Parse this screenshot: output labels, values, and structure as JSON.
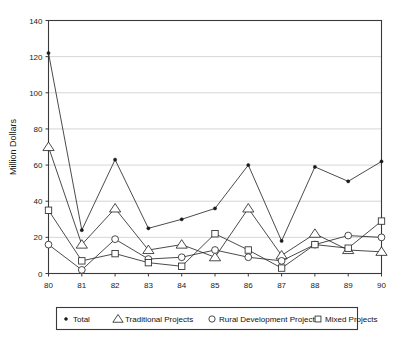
{
  "chart_data": {
    "type": "line",
    "title": "",
    "subtitle": "",
    "xlabel": "",
    "ylabel": "Million Dollars",
    "x": [
      "80",
      "81",
      "82",
      "83",
      "84",
      "85",
      "86",
      "87",
      "88",
      "89",
      "90"
    ],
    "categories": [
      "80",
      "81",
      "82",
      "83",
      "84",
      "85",
      "86",
      "87",
      "88",
      "89",
      "90"
    ],
    "xlim": [
      80,
      90
    ],
    "ylim": [
      0,
      140
    ],
    "ytick_labels": [
      "0",
      "20",
      "40",
      "60",
      "80",
      "100",
      "120",
      "140"
    ],
    "ytick_values": [
      0,
      20,
      40,
      60,
      80,
      100,
      120,
      140
    ],
    "xtick_labels": [
      "80",
      "81",
      "82",
      "83",
      "84",
      "85",
      "86",
      "87",
      "88",
      "89",
      "90"
    ],
    "grid": "horizontal",
    "legend_position": "bottom",
    "series": [
      {
        "name": "Total",
        "marker": "dot",
        "values": [
          122,
          24,
          63,
          25,
          30,
          36,
          60,
          18,
          59,
          51,
          62
        ]
      },
      {
        "name": "Traditional Projects",
        "marker": "triangle",
        "values": [
          70,
          16,
          36,
          13,
          16,
          9,
          36,
          10,
          22,
          13,
          12
        ]
      },
      {
        "name": "Rural Development Projects",
        "marker": "circle",
        "values": [
          16,
          2,
          19,
          8,
          9,
          13,
          9,
          7,
          16,
          21,
          20
        ]
      },
      {
        "name": "Mixed Projects",
        "marker": "square",
        "values": [
          35,
          7,
          11,
          6,
          4,
          22,
          13,
          3,
          16,
          14,
          29
        ]
      }
    ]
  },
  "legend": {
    "items": [
      {
        "label": "Total",
        "marker": "dot"
      },
      {
        "label": "Traditional Projects",
        "marker": "triangle"
      },
      {
        "label": "Rural Development Projects",
        "marker": "circle"
      },
      {
        "label": "Mixed Projects",
        "marker": "square"
      }
    ]
  },
  "axis": {
    "y_title": "Million Dollars"
  },
  "colors": {
    "line": "#2b2b2b",
    "grid": "#b9b9b9",
    "frame": "#3a3a3a",
    "text": "#1a1a1a",
    "marker_fill": "#ffffff"
  }
}
